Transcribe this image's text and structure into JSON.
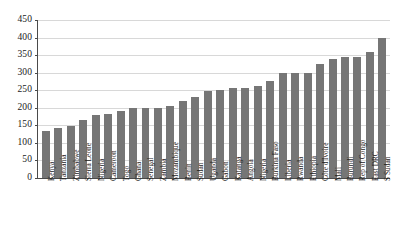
{
  "chart_data": {
    "type": "bar",
    "title": "",
    "subtitle": "",
    "xlabel": "",
    "ylabel": "",
    "ylim": [
      0,
      450
    ],
    "ytick_labels": [
      "450",
      "400",
      "350",
      "300",
      "250",
      "200",
      "150",
      "100",
      "50",
      "0"
    ],
    "ytick_values": [
      450,
      400,
      350,
      300,
      250,
      200,
      150,
      100,
      50,
      0
    ],
    "grid": true,
    "legend": null,
    "legend_position": "none",
    "bar_color": "#767676",
    "axis_color": "#4a4a4a",
    "gridline_color": "#d8d8d8",
    "categories": [
      "Kenya",
      "Tanzania",
      "Zimbabwe",
      "Sierra Leone",
      "Nigeria",
      "Cameroon",
      "Togo",
      "Ghana",
      "Senegal",
      "Zambia",
      "Mozambique",
      "Benin",
      "Sudan",
      "Uganda",
      "Gabon",
      "Katanga",
      "Angola",
      "Nigeria",
      "Burkina Faso",
      "Liberia",
      "Rwanda",
      "Ethiopia",
      "Côte d'Ivoire",
      "Mali",
      "Burundi",
      "Rep of Congo",
      "East DRC",
      "S Sudan"
    ],
    "values": [
      135,
      142,
      148,
      165,
      180,
      182,
      190,
      198,
      200,
      200,
      205,
      218,
      230,
      248,
      250,
      255,
      255,
      262,
      275,
      300,
      300,
      300,
      325,
      340,
      345,
      345,
      360,
      400
    ]
  }
}
